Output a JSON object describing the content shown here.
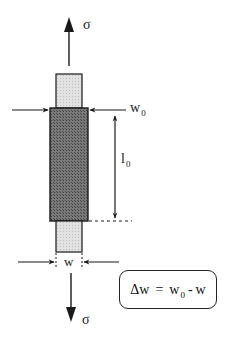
{
  "diagram": {
    "labels": {
      "sigma_top": "σ",
      "sigma_bottom": "σ",
      "w0_main": "w",
      "w0_sub": "0",
      "l0_main": "l",
      "l0_sub": "0",
      "w_label": "w"
    },
    "formula": {
      "lhs": "Δw",
      "eq": "=",
      "rhs_w0_main": "w",
      "rhs_w0_sub": "0",
      "minus": "-",
      "rhs_w": "w"
    },
    "colors": {
      "stroke": "#1a1a1a",
      "gauge_fill": "#6e6e6e",
      "grip_fill": "#d8d8d8",
      "background": "#ffffff"
    },
    "elements": [
      {
        "name": "upper-grip",
        "shape": "rect",
        "x": 56,
        "y": 74,
        "w": 26,
        "h": 34
      },
      {
        "name": "gauge-section",
        "shape": "rect",
        "x": 50,
        "y": 108,
        "w": 38,
        "h": 113
      },
      {
        "name": "lower-grip",
        "shape": "rect",
        "x": 56,
        "y": 221,
        "w": 26,
        "h": 31
      },
      {
        "name": "stress-arrow-top",
        "direction": "up"
      },
      {
        "name": "stress-arrow-bottom",
        "direction": "down"
      },
      {
        "name": "w0-arrows",
        "direction": "inward"
      },
      {
        "name": "l0-dimension-arrow",
        "direction": "both"
      },
      {
        "name": "w-arrows",
        "direction": "inward"
      }
    ]
  }
}
